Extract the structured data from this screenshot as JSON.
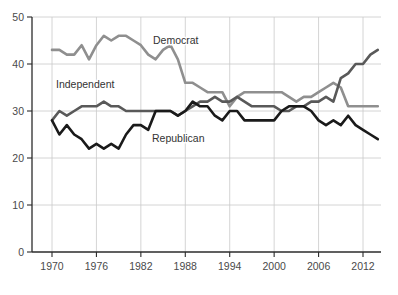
{
  "chart_data": {
    "type": "line",
    "title": "",
    "subtitle": "",
    "xlabel": "",
    "ylabel": "",
    "xlim": [
      1970,
      2014
    ],
    "ylim": [
      0,
      50
    ],
    "grid": true,
    "legend_position": "inline-annotations",
    "x_ticks": [
      "1970",
      "1976",
      "1982",
      "1988",
      "1994",
      "2000",
      "2006",
      "2012"
    ],
    "x_tick_values": [
      1970,
      1976,
      1982,
      1988,
      1994,
      2000,
      2006,
      2012
    ],
    "y_ticks": [
      "0",
      "10",
      "20",
      "30",
      "40",
      "50"
    ],
    "y_tick_values": [
      0,
      10,
      20,
      30,
      40,
      50
    ],
    "x": [
      1970,
      1971,
      1972,
      1973,
      1974,
      1975,
      1976,
      1977,
      1978,
      1979,
      1980,
      1981,
      1982,
      1983,
      1984,
      1985,
      1986,
      1987,
      1988,
      1989,
      1990,
      1991,
      1992,
      1993,
      1994,
      1995,
      1996,
      1997,
      1998,
      1999,
      2000,
      2001,
      2002,
      2003,
      2004,
      2005,
      2006,
      2007,
      2008,
      2009,
      2010,
      2011,
      2012,
      2013,
      2014
    ],
    "series": [
      {
        "name": "Democrat",
        "color": "#8f8f8f",
        "label_x": 1994,
        "label_y": 45,
        "values": [
          43,
          43,
          42,
          42,
          44,
          41,
          44,
          46,
          45,
          46,
          46,
          45,
          44,
          42,
          41,
          43,
          44,
          41,
          36,
          36,
          35,
          34,
          34,
          34,
          31,
          33,
          34,
          34,
          34,
          34,
          34,
          34,
          33,
          32,
          33,
          33,
          34,
          35,
          36,
          35,
          31,
          31,
          31,
          31,
          31
        ]
      },
      {
        "name": "Independent",
        "color": "#595959",
        "label_x": 1976,
        "label_y": 36,
        "values": [
          28,
          30,
          29,
          30,
          31,
          31,
          31,
          32,
          31,
          31,
          30,
          30,
          30,
          30,
          30,
          30,
          30,
          29,
          30,
          31,
          32,
          32,
          33,
          32,
          32,
          33,
          32,
          31,
          31,
          31,
          31,
          30,
          30,
          31,
          31,
          32,
          32,
          33,
          32,
          37,
          38,
          40,
          40,
          42,
          43
        ]
      },
      {
        "name": "Republican",
        "color": "#1a1a1a",
        "label_x": 1994,
        "label_y": 26,
        "values": [
          28,
          25,
          27,
          25,
          24,
          22,
          23,
          22,
          23,
          22,
          25,
          27,
          27,
          26,
          30,
          30,
          30,
          29,
          30,
          32,
          31,
          31,
          29,
          28,
          30,
          30,
          28,
          28,
          28,
          28,
          28,
          30,
          31,
          31,
          31,
          30,
          28,
          27,
          28,
          27,
          29,
          27,
          26,
          25,
          24
        ]
      }
    ],
    "annotations": [
      {
        "text": "Democrat",
        "x_px": 153,
        "y_px": 44
      },
      {
        "text": "Independent",
        "x_px": 56,
        "y_px": 88
      },
      {
        "text": "Republican",
        "x_px": 152,
        "y_px": 142
      }
    ]
  },
  "colors": {
    "background": "#ffffff",
    "grid": "#c9c9c9",
    "axis": "#2b2b2b",
    "tick_text": "#4a4a4a",
    "label_text": "#333333"
  }
}
